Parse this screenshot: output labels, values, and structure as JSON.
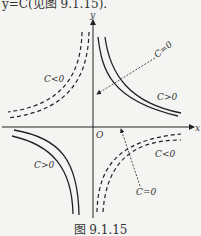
{
  "top_text": "y=C(见图 9.1.15).",
  "figure": {
    "caption": "图 9.1.15",
    "axes": {
      "x_label": "x",
      "y_label": "y",
      "origin_label": "O"
    },
    "curve_labels": {
      "q1_c_zero": "C=0",
      "q1_c_pos": "C>0",
      "q2_c_neg": "C<0",
      "q3_c_pos": "C>0",
      "q4_c_neg": "C<0",
      "q4_c_zero": "C=0"
    },
    "legend": {
      "solid": "C>0",
      "dashed": "C<0"
    }
  }
}
